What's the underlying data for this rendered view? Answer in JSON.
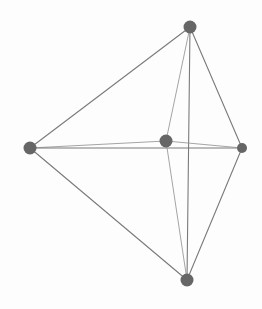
{
  "diagram": {
    "type": "graph",
    "width": 262,
    "height": 309,
    "background": "#fdfdfd",
    "node_color": "#666666",
    "edge_color_dark": "#7a7a7a",
    "edge_color_light": "#9a9a9a",
    "nodes": [
      {
        "id": "top",
        "x": 190,
        "y": 27,
        "r": 6.5
      },
      {
        "id": "left",
        "x": 30,
        "y": 148,
        "r": 6.5
      },
      {
        "id": "center",
        "x": 166,
        "y": 141,
        "r": 6.5
      },
      {
        "id": "right",
        "x": 242,
        "y": 148,
        "r": 5
      },
      {
        "id": "bottom",
        "x": 187,
        "y": 280,
        "r": 6.5
      }
    ],
    "edges": [
      {
        "from": "top",
        "to": "left",
        "shade": "dark"
      },
      {
        "from": "top",
        "to": "center",
        "shade": "light"
      },
      {
        "from": "top",
        "to": "bottom",
        "shade": "dark"
      },
      {
        "from": "top",
        "to": "right",
        "shade": "dark"
      },
      {
        "from": "left",
        "to": "center",
        "shade": "light"
      },
      {
        "from": "left",
        "to": "right",
        "shade": "dark"
      },
      {
        "from": "left",
        "to": "bottom",
        "shade": "dark"
      },
      {
        "from": "center",
        "to": "right",
        "shade": "light"
      },
      {
        "from": "center",
        "to": "bottom",
        "shade": "light"
      },
      {
        "from": "right",
        "to": "bottom",
        "shade": "dark"
      }
    ]
  }
}
